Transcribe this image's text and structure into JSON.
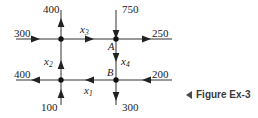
{
  "figure": {
    "caption_text": "Figure Ex-3",
    "caption_arrow_icon": "left-triangle-icon",
    "line_color": "#333333",
    "node_color": "#111111",
    "text_color": "#1a1a1a"
  },
  "nodes": [
    {
      "id": "node-top-left",
      "label": "",
      "x": 61,
      "y": 39
    },
    {
      "id": "node-a",
      "label": "A",
      "x": 116,
      "y": 38
    },
    {
      "id": "node-bottom-left",
      "label": "",
      "x": 61,
      "y": 80
    },
    {
      "id": "node-b",
      "label": "B",
      "x": 116,
      "y": 80
    }
  ],
  "external_flows": [
    {
      "id": "flow-in-left-top",
      "value": "300",
      "direction": "right",
      "position": "left-top"
    },
    {
      "id": "flow-out-top-left",
      "value": "400",
      "direction": "up",
      "position": "top-left"
    },
    {
      "id": "flow-in-top-right",
      "value": "750",
      "direction": "down",
      "position": "top-right"
    },
    {
      "id": "flow-out-right-top",
      "value": "250",
      "direction": "right",
      "position": "right-top"
    },
    {
      "id": "flow-out-left-bottom",
      "value": "400",
      "direction": "left",
      "position": "left-bottom"
    },
    {
      "id": "flow-in-bottom-left",
      "value": "100",
      "direction": "up",
      "position": "bottom-left"
    },
    {
      "id": "flow-out-bottom-right",
      "value": "300",
      "direction": "down",
      "position": "bottom-right"
    },
    {
      "id": "flow-in-right-bottom",
      "value": "200",
      "direction": "left",
      "position": "right-bottom"
    }
  ],
  "branch_variables": [
    {
      "id": "branch-x1",
      "name": "x",
      "subscript": "1",
      "direction": "left",
      "segment": "bottom-horizontal"
    },
    {
      "id": "branch-x2",
      "name": "x",
      "subscript": "2",
      "direction": "up",
      "segment": "left-vertical"
    },
    {
      "id": "branch-x3",
      "name": "x",
      "subscript": "3",
      "direction": "right",
      "segment": "top-horizontal"
    },
    {
      "id": "branch-x4",
      "name": "x",
      "subscript": "4",
      "direction": "down",
      "segment": "right-vertical"
    }
  ]
}
